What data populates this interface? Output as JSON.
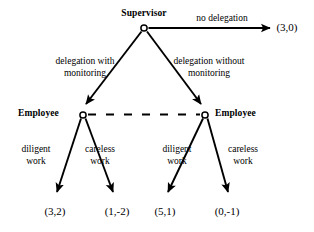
{
  "diagram": {
    "type": "extensive-form-game-tree",
    "title_label": "Supervisor",
    "colors": {
      "ink": "#000000",
      "background": "#ffffff"
    },
    "players": {
      "root_player": "Supervisor",
      "left_player": "Employee",
      "right_player": "Employee"
    },
    "nodes": [
      {
        "id": "root",
        "player": "Supervisor",
        "x": 144,
        "y": 28
      },
      {
        "id": "left",
        "player": "Employee",
        "x": 83,
        "y": 115
      },
      {
        "id": "right",
        "player": "Employee",
        "x": 205,
        "y": 115
      }
    ],
    "information_set": {
      "style": "dashed",
      "from_node": "left",
      "to_node": "right",
      "dash_count": 6
    },
    "actions": {
      "no_delegation": "no delegation",
      "delegation_with_monitoring_line1": "delegation with",
      "delegation_with_monitoring_line2": "monitoring",
      "delegation_without_monitoring_line1": "delegation without",
      "delegation_without_monitoring_line2": "monitoring",
      "diligent_line1": "diligent",
      "diligent_line2": "work",
      "careless_line1": "careless",
      "careless_line2": "work"
    },
    "payoffs": {
      "no_delegation": "(3,0)",
      "left_diligent": "(3,2)",
      "left_careless": "(1,-2)",
      "right_diligent": "(5,1)",
      "right_careless": "(0,-1)"
    }
  }
}
